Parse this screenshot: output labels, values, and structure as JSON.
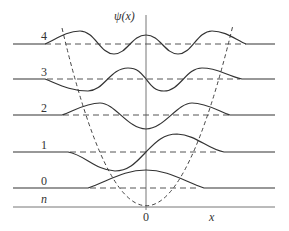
{
  "figure": {
    "y_axis_label": "ψ(x)",
    "x_axis_label": "x",
    "origin_label": "0",
    "level_axis_label": "n",
    "levels": [
      {
        "n": "0",
        "label": "0"
      },
      {
        "n": "1",
        "label": "1"
      },
      {
        "n": "2",
        "label": "2"
      },
      {
        "n": "3",
        "label": "3"
      },
      {
        "n": "4",
        "label": "4"
      }
    ],
    "colors": {
      "curve": "#333333",
      "dashed": "#555555",
      "axis": "#666666"
    }
  }
}
